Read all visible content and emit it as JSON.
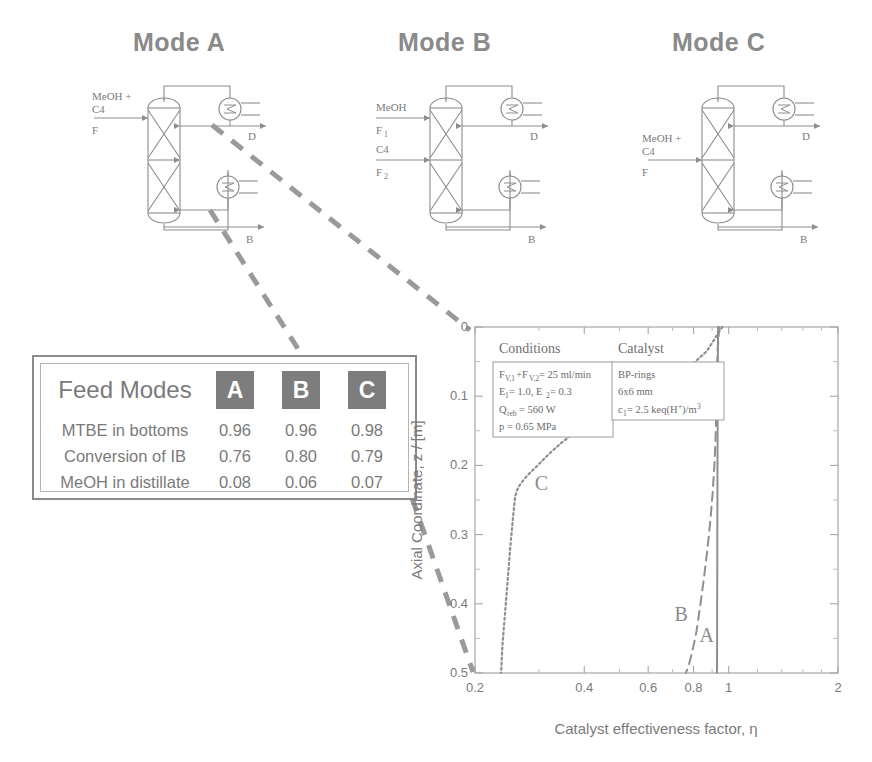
{
  "figure": {
    "background": "#ffffff",
    "ink": "#7a7a7a"
  },
  "modes": [
    {
      "id": "A",
      "title": "Mode A",
      "feeds": [
        {
          "lines": [
            "MeOH +",
            "C4"
          ],
          "stream": "F",
          "position": "top"
        }
      ],
      "distillate_label": "D",
      "bottoms_label": "B",
      "beds": 2
    },
    {
      "id": "B",
      "title": "Mode B",
      "feeds": [
        {
          "lines": [
            "MeOH"
          ],
          "stream": "F",
          "subscript": "1",
          "position": "top"
        },
        {
          "lines": [
            "C4"
          ],
          "stream": "F",
          "subscript": "2",
          "position": "middle"
        }
      ],
      "distillate_label": "D",
      "bottoms_label": "B",
      "beds": 2
    },
    {
      "id": "C",
      "title": "Mode C",
      "feeds": [
        {
          "lines": [
            "MeOH +",
            "C4"
          ],
          "stream": "F",
          "position": "middle"
        }
      ],
      "distillate_label": "D",
      "bottoms_label": "B",
      "beds": 2
    }
  ],
  "feed_table": {
    "title": "Feed Modes",
    "columns": [
      "A",
      "B",
      "C"
    ],
    "rows": [
      {
        "label": "MTBE in bottoms",
        "values": [
          "0.96",
          "0.96",
          "0.98"
        ]
      },
      {
        "label": "Conversion of IB",
        "values": [
          "0.76",
          "0.80",
          "0.79"
        ]
      },
      {
        "label": "MeOH in distillate",
        "values": [
          "0.08",
          "0.06",
          "0.07"
        ]
      }
    ],
    "header_chip_color": "#7d7d7d",
    "header_text_color": "#ffffff",
    "border_color": "#8b8b8b"
  },
  "info_boxes": [
    {
      "heading": "Conditions",
      "lines": [
        "F_V,1+F_V,2 = 25 ml/min",
        "E_1 = 1.0, E_2 = 0.3",
        "Q_reb = 560 W",
        "p = 0.65 MPa"
      ]
    },
    {
      "heading": "Catalyst",
      "lines": [
        "BP-rings",
        "6x6 mm",
        "c_1 = 2.5 keq(H+)/m3"
      ]
    }
  ],
  "chart_data": {
    "type": "line",
    "title": "",
    "xlabel": "Catalyst effectiveness factor, η",
    "ylabel": "Axial Coordinate, z / [m]",
    "xscale": "log",
    "xlim": [
      0.2,
      2
    ],
    "ylim": [
      0,
      0.5
    ],
    "y_inverted": true,
    "grid": false,
    "xticks": [
      "0.2",
      "0.4",
      "0.6",
      "0.8",
      "1",
      "2"
    ],
    "xtick_values": [
      0.2,
      0.4,
      0.6,
      0.8,
      1,
      2
    ],
    "yticks": [
      "0",
      "0.1",
      "0.2",
      "0.3",
      "0.4",
      "0.5"
    ],
    "ytick_values": [
      0,
      0.1,
      0.2,
      0.3,
      0.4,
      0.5
    ],
    "legend_position": "inline-annotations",
    "series": [
      {
        "name": "A",
        "style": "solid",
        "label": "A",
        "label_at": {
          "x": 0.87,
          "y": 0.455
        },
        "points": [
          [
            0.935,
            0.0
          ],
          [
            0.934,
            0.02
          ],
          [
            0.933,
            0.05
          ],
          [
            0.933,
            0.08
          ],
          [
            0.932,
            0.12
          ],
          [
            0.932,
            0.16
          ],
          [
            0.931,
            0.2
          ],
          [
            0.931,
            0.25
          ],
          [
            0.93,
            0.3
          ],
          [
            0.93,
            0.35
          ],
          [
            0.929,
            0.4
          ],
          [
            0.929,
            0.45
          ],
          [
            0.928,
            0.5
          ]
        ]
      },
      {
        "name": "B",
        "style": "dashed",
        "label": "B",
        "label_at": {
          "x": 0.74,
          "y": 0.425
        },
        "points": [
          [
            0.94,
            0.0
          ],
          [
            0.938,
            0.015
          ],
          [
            0.933,
            0.03
          ],
          [
            0.93,
            0.05
          ],
          [
            0.928,
            0.08
          ],
          [
            0.925,
            0.12
          ],
          [
            0.92,
            0.16
          ],
          [
            0.913,
            0.2
          ],
          [
            0.903,
            0.24
          ],
          [
            0.89,
            0.28
          ],
          [
            0.874,
            0.32
          ],
          [
            0.856,
            0.36
          ],
          [
            0.836,
            0.4
          ],
          [
            0.815,
            0.44
          ],
          [
            0.793,
            0.47
          ],
          [
            0.775,
            0.49
          ],
          [
            0.762,
            0.5
          ]
        ]
      },
      {
        "name": "C",
        "style": "dotted",
        "label": "C",
        "label_at": {
          "x": 0.305,
          "y": 0.235
        },
        "points": [
          [
            0.96,
            0.0
          ],
          [
            0.87,
            0.035
          ],
          [
            0.79,
            0.055
          ],
          [
            0.72,
            0.07
          ],
          [
            0.66,
            0.082
          ],
          [
            0.6,
            0.092
          ],
          [
            0.545,
            0.102
          ],
          [
            0.5,
            0.112
          ],
          [
            0.46,
            0.122
          ],
          [
            0.425,
            0.133
          ],
          [
            0.395,
            0.144
          ],
          [
            0.368,
            0.156
          ],
          [
            0.345,
            0.168
          ],
          [
            0.325,
            0.18
          ],
          [
            0.308,
            0.192
          ],
          [
            0.295,
            0.202
          ],
          [
            0.283,
            0.211
          ],
          [
            0.273,
            0.22
          ],
          [
            0.266,
            0.228
          ],
          [
            0.261,
            0.236
          ],
          [
            0.258,
            0.245
          ],
          [
            0.256,
            0.262
          ],
          [
            0.253,
            0.29
          ],
          [
            0.25,
            0.32
          ],
          [
            0.247,
            0.355
          ],
          [
            0.244,
            0.39
          ],
          [
            0.241,
            0.425
          ],
          [
            0.238,
            0.46
          ],
          [
            0.236,
            0.5
          ]
        ]
      }
    ]
  }
}
